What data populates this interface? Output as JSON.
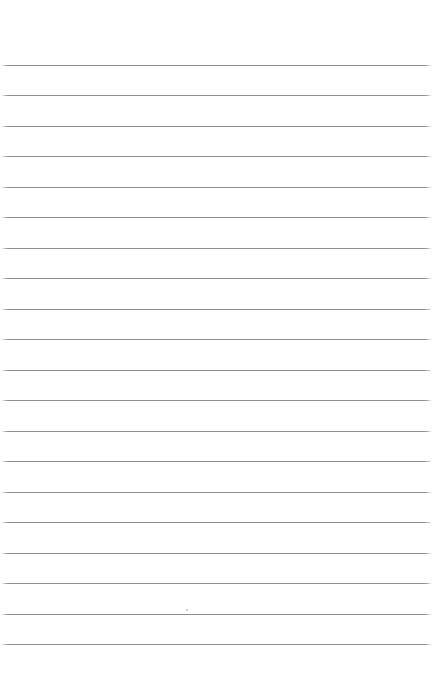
{
  "document": {
    "type": "lined-paper",
    "title": "Blank lined notepaper",
    "page_width": 435,
    "page_height": 687,
    "background_color": "#ffffff",
    "text_content": ""
  },
  "rules": {
    "count": 20,
    "color": "#8f8f8f",
    "thickness_px": 1,
    "spacing_px": 30.47,
    "first_line_y": 65,
    "last_line_y": 644,
    "left_margin_x": 2,
    "right_margin_x": 431,
    "line_length_px": 429,
    "top_blank_margin_px": 65,
    "bottom_blank_margin_px": 43,
    "y_positions": [
      65,
      95,
      126,
      156,
      187,
      217,
      248,
      278,
      309,
      339,
      370,
      400,
      431,
      461,
      492,
      522,
      553,
      583,
      614,
      644
    ]
  },
  "marks": [
    {
      "name": "stray-speck",
      "x": 186,
      "y": 609
    }
  ]
}
